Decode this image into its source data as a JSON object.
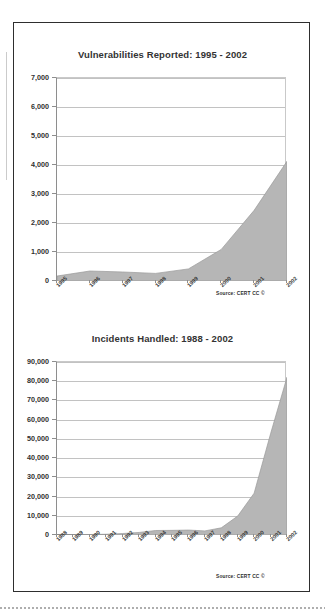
{
  "document": {
    "source_note": "Source: CERT CC ©"
  },
  "charts": [
    {
      "id": "vulnerabilities",
      "title": "Vulnerabilities Reported: 1995 - 2002",
      "ytick_labels": [
        "7,000",
        "6,000",
        "5,000",
        "4,000",
        "3,000",
        "2,000",
        "1,000",
        "0"
      ],
      "xtick_labels": [
        "1995",
        "1996",
        "1997",
        "1998",
        "1999",
        "2000",
        "2001",
        "2002"
      ],
      "source_note": "Source: CERT CC ©"
    },
    {
      "id": "incidents",
      "title": "Incidents Handled: 1988 - 2002",
      "ytick_labels": [
        "90,000",
        "80,000",
        "70,000",
        "60,000",
        "50,000",
        "40,000",
        "30,000",
        "20,000",
        "10,000",
        "0"
      ],
      "xtick_labels": [
        "1988",
        "1989",
        "1990",
        "1991",
        "1992",
        "1993",
        "1994",
        "1995",
        "1996",
        "1997",
        "1998",
        "1999",
        "2000",
        "2001",
        "2002"
      ],
      "source_note": "Source: CERT CC ©"
    }
  ],
  "chart_data": [
    {
      "type": "area",
      "title": "Vulnerabilities Reported: 1995 - 2002",
      "xlabel": "",
      "ylabel": "",
      "categories": [
        "1995",
        "1996",
        "1997",
        "1998",
        "1999",
        "2000",
        "2001",
        "2002"
      ],
      "values": [
        171,
        345,
        311,
        262,
        417,
        1090,
        2437,
        4129
      ],
      "ylim": [
        0,
        7000
      ],
      "ytick_step": 1000,
      "grid": true,
      "legend": "none",
      "fill_color": "#b6b6b6",
      "annotations": [
        "Source: CERT CC ©"
      ]
    },
    {
      "type": "area",
      "title": "Incidents Handled: 1988 - 2002",
      "xlabel": "",
      "ylabel": "",
      "categories": [
        "1988",
        "1989",
        "1990",
        "1991",
        "1992",
        "1993",
        "1994",
        "1995",
        "1996",
        "1997",
        "1998",
        "1999",
        "2000",
        "2001",
        "2002"
      ],
      "values": [
        6,
        132,
        252,
        406,
        773,
        1334,
        2340,
        2412,
        2573,
        2134,
        3734,
        9859,
        21756,
        52658,
        82094
      ],
      "ylim": [
        0,
        90000
      ],
      "ytick_step": 10000,
      "grid": true,
      "legend": "none",
      "fill_color": "#b6b6b6",
      "annotations": [
        "Source: CERT CC ©"
      ]
    }
  ]
}
